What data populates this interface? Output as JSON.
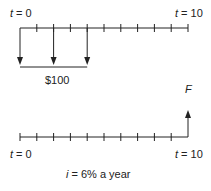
{
  "top_diagram": {
    "start_label_var": "t",
    "start_label_rest": " = 0",
    "end_label_var": "t",
    "end_label_rest": " = 10",
    "periods": 10,
    "payments_at_periods": [
      0,
      2,
      4
    ],
    "payment_direction": "down",
    "payment_label": "$100"
  },
  "bottom_diagram": {
    "start_label_var": "t",
    "start_label_rest": " = 0",
    "end_label_var": "t",
    "end_label_rest": " = 10",
    "periods": 10,
    "future_value_label": "F",
    "future_value_period": 10,
    "future_value_direction": "up"
  },
  "interest_label_var": "i",
  "interest_label_rest": " = 6% a year",
  "colors": {
    "line": "#222222"
  }
}
